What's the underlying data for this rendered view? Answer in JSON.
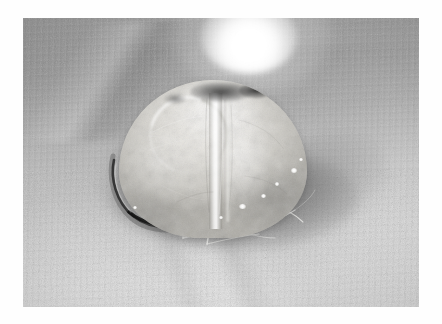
{
  "image": {
    "kind": "photograph",
    "modality": "clinical-intraoperative-photograph",
    "color_mode": "grayscale",
    "subject": "Explanted dome-shaped tissue specimen resting on woven surgical drape",
    "orientation": "landscape",
    "canvas": {
      "width": 442,
      "height": 324,
      "background_color": "#ffffff"
    },
    "photo_frame": {
      "left": 23,
      "top": 18,
      "width": 396,
      "height": 289
    },
    "visible_text": "",
    "palette": {
      "border": "#ffffff",
      "drape_top": "#949494",
      "drape_mid": "#b8b8b8",
      "drape_bottom": "#dbdbdb",
      "specimen_highlight": "#f4f2ee",
      "specimen_mid": "#d3d1cb",
      "specimen_shade": "#b0aea8",
      "shadow": "#4a4a4a",
      "dark_necrosis": "#242424",
      "specular_white": "#ffffff"
    },
    "elements": [
      {
        "name": "lamp-highlight",
        "description": "Blown-out specular light source at top centre",
        "cx": 226,
        "cy": 20
      },
      {
        "name": "drape-fold-upper-left",
        "description": "Soft diagonal fold crease across upper-left drape"
      },
      {
        "name": "drape-seam-lower",
        "description": "Diagonal crease/seam crossing lower half of drape"
      },
      {
        "name": "specimen-dome",
        "description": "Pale mottled dome-shaped tissue mass, centre of frame",
        "cx": 190,
        "cy": 141
      },
      {
        "name": "specimen-central-ridge",
        "description": "Vertical bright ridge / closure line down the dome"
      },
      {
        "name": "specimen-dark-margin",
        "description": "Dark mottled discolouration along superior margin of dome"
      },
      {
        "name": "cast-shadow",
        "description": "Grey cast shadow pooled beneath and right of the specimen"
      },
      {
        "name": "wire-arc",
        "description": "Dark thin curved arc (wire / marker) at lower-left of specimen"
      },
      {
        "name": "suture-filaments",
        "description": "Fine translucent threads trailing from the base of the specimen"
      },
      {
        "name": "specular-glints",
        "description": "Small bright reflections on the wet filaments"
      }
    ]
  }
}
